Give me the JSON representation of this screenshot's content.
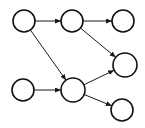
{
  "diagram": {
    "type": "directed-graph",
    "background": "#ffffff",
    "edge_color": "#1a1a1a",
    "node_stroke_color": "#111111",
    "node_fill": "#ffffff",
    "canvas": {
      "width": 145,
      "height": 128
    },
    "nodes": [
      {
        "id": "top-left",
        "x": 24,
        "y": 21,
        "r": 11
      },
      {
        "id": "top-middle",
        "x": 72,
        "y": 21,
        "r": 11
      },
      {
        "id": "top-right",
        "x": 123,
        "y": 21,
        "r": 11
      },
      {
        "id": "middle-right",
        "x": 125,
        "y": 65,
        "r": 12
      },
      {
        "id": "bottom-left",
        "x": 23,
        "y": 90,
        "r": 11
      },
      {
        "id": "bottom-middle",
        "x": 73,
        "y": 90,
        "r": 12
      },
      {
        "id": "bottom-right",
        "x": 122,
        "y": 110,
        "r": 11
      }
    ],
    "edges": [
      {
        "from": "top-left",
        "to": "top-middle"
      },
      {
        "from": "top-middle",
        "to": "top-right"
      },
      {
        "from": "top-left",
        "to": "bottom-middle"
      },
      {
        "from": "top-middle",
        "to": "middle-right"
      },
      {
        "from": "bottom-left",
        "to": "bottom-middle"
      },
      {
        "from": "bottom-middle",
        "to": "middle-right"
      },
      {
        "from": "bottom-middle",
        "to": "bottom-right"
      }
    ]
  }
}
